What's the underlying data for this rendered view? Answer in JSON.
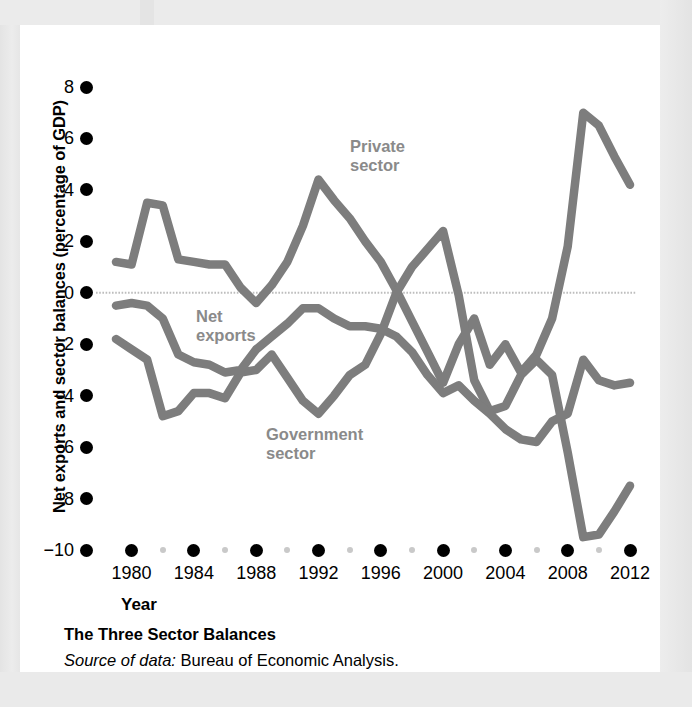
{
  "figure": {
    "y_axis_title": "Net exports and sector balances (percentage of GDP)",
    "x_axis_title": "Year",
    "caption_title": "The Three Sector Balances",
    "caption_source_lead": "Source of data:",
    "caption_source_rest": " Bureau of Economic Analysis."
  },
  "labels": {
    "private": "Private\nsector",
    "net_exports": "Net\nexports",
    "government": "Government\nsector"
  },
  "colors": {
    "line": "#7d7d7d",
    "zero_line": "#bdbdbd",
    "tick_major": "#000000",
    "tick_minor": "#c9c9c9",
    "panel": "#ffffff",
    "page": "#e9e9e9",
    "label_text": "#8a8a8a"
  },
  "chart_data": {
    "type": "line",
    "title": "The Three Sector Balances",
    "xlabel": "Year",
    "ylabel": "Net exports and sector balances (percentage of GDP)",
    "xlim": [
      1979,
      2012
    ],
    "ylim": [
      -10,
      8
    ],
    "ytick_labels": [
      "8",
      "6",
      "4",
      "2",
      "0",
      "−2",
      "−4",
      "−6",
      "−8",
      "−10"
    ],
    "ytick_values": [
      8,
      6,
      4,
      2,
      0,
      -2,
      -4,
      -6,
      -8,
      -10
    ],
    "xtick_labels": [
      "1980",
      "1984",
      "1988",
      "1992",
      "1996",
      "2000",
      "2004",
      "2008",
      "2012"
    ],
    "xtick_values": [
      1980,
      1984,
      1988,
      1992,
      1996,
      2000,
      2004,
      2008,
      2012
    ],
    "xtick_minor_values": [
      1982,
      1986,
      1990,
      1994,
      1998,
      2002,
      2006,
      2010
    ],
    "grid": false,
    "zero_line": true,
    "legend_position": "inline-annotations",
    "x": [
      1979,
      1980,
      1981,
      1982,
      1983,
      1984,
      1985,
      1986,
      1987,
      1988,
      1989,
      1990,
      1991,
      1992,
      1993,
      1994,
      1995,
      1996,
      1997,
      1998,
      1999,
      2000,
      2001,
      2002,
      2003,
      2004,
      2005,
      2006,
      2007,
      2008,
      2009,
      2010,
      2011,
      2012
    ],
    "series": [
      {
        "name": "Private sector",
        "values": [
          1.2,
          1.1,
          3.5,
          3.4,
          1.3,
          1.2,
          1.1,
          1.1,
          0.2,
          -0.4,
          0.3,
          1.2,
          2.6,
          4.4,
          3.6,
          2.9,
          2.0,
          1.2,
          0.1,
          -1.1,
          -2.3,
          -3.5,
          -2.0,
          -1.0,
          -2.8,
          -2.0,
          -3.1,
          -2.4,
          -1.0,
          1.8,
          7.0,
          6.5,
          5.3,
          4.2
        ]
      },
      {
        "name": "Government sector",
        "values": [
          -1.8,
          -2.2,
          -2.6,
          -4.8,
          -4.6,
          -3.9,
          -3.9,
          -4.1,
          -3.1,
          -3.0,
          -2.4,
          -3.3,
          -4.2,
          -4.7,
          -4.0,
          -3.2,
          -2.8,
          -1.6,
          0.0,
          1.0,
          1.7,
          2.4,
          -0.1,
          -3.4,
          -4.6,
          -4.4,
          -3.2,
          -2.6,
          -3.2,
          -6.2,
          -9.5,
          -9.4,
          -8.5,
          -7.5
        ]
      },
      {
        "name": "Net exports",
        "values": [
          -0.5,
          -0.4,
          -0.5,
          -1.0,
          -2.4,
          -2.7,
          -2.8,
          -3.1,
          -3.0,
          -2.2,
          -1.7,
          -1.2,
          -0.6,
          -0.6,
          -1.0,
          -1.3,
          -1.3,
          -1.4,
          -1.7,
          -2.3,
          -3.2,
          -3.9,
          -3.6,
          -4.2,
          -4.7,
          -5.3,
          -5.7,
          -5.8,
          -5.0,
          -4.7,
          -2.6,
          -3.4,
          -3.6,
          -3.5
        ]
      }
    ]
  }
}
